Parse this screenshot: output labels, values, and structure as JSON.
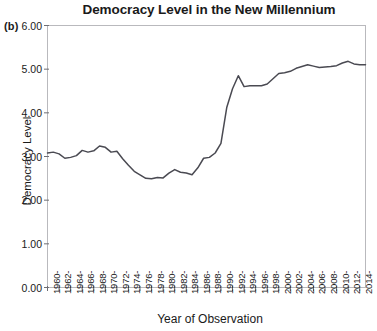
{
  "figure": {
    "panel_label": "(b)",
    "title": "Democracy Level in the New Millennium"
  },
  "chart_data": {
    "type": "line",
    "title": "Democracy Level in the New Millennium",
    "xlabel": "Year of Observation",
    "ylabel": "Democracy Level",
    "ylim": [
      0.0,
      6.0
    ],
    "ytick_labels": [
      "0.00",
      "1.00",
      "2.00",
      "3.00",
      "4.00",
      "5.00",
      "6.00"
    ],
    "ytick_values": [
      0.0,
      1.0,
      2.0,
      3.0,
      4.0,
      5.0,
      6.0
    ],
    "xlim": [
      1960,
      2015
    ],
    "xtick_labels": [
      "1960",
      "1962",
      "1964",
      "1966",
      "1968",
      "1970",
      "1972",
      "1974",
      "1976",
      "1978",
      "1980",
      "1982",
      "1984",
      "1986",
      "1988",
      "1990",
      "1992",
      "1994",
      "1996",
      "1998",
      "2000",
      "2002",
      "2004",
      "2006",
      "2008",
      "2010",
      "2012",
      "2014"
    ],
    "grid": false,
    "legend": null,
    "line_color": "#4a4a52",
    "x": [
      1960,
      1961,
      1962,
      1963,
      1964,
      1965,
      1966,
      1967,
      1968,
      1969,
      1970,
      1971,
      1972,
      1973,
      1974,
      1975,
      1976,
      1977,
      1978,
      1979,
      1980,
      1981,
      1982,
      1983,
      1984,
      1985,
      1986,
      1987,
      1988,
      1989,
      1990,
      1991,
      1992,
      1993,
      1994,
      1995,
      1996,
      1997,
      1998,
      1999,
      2000,
      2001,
      2002,
      2003,
      2004,
      2005,
      2006,
      2007,
      2008,
      2009,
      2010,
      2011,
      2012,
      2013,
      2014,
      2015
    ],
    "values": [
      3.08,
      3.1,
      3.06,
      2.96,
      2.98,
      3.02,
      3.14,
      3.1,
      3.13,
      3.24,
      3.21,
      3.1,
      3.12,
      2.95,
      2.8,
      2.66,
      2.58,
      2.5,
      2.49,
      2.52,
      2.51,
      2.62,
      2.7,
      2.64,
      2.62,
      2.58,
      2.74,
      2.96,
      2.98,
      3.08,
      3.3,
      4.12,
      4.55,
      4.85,
      4.6,
      4.62,
      4.62,
      4.62,
      4.66,
      4.78,
      4.9,
      4.92,
      4.95,
      5.02,
      5.06,
      5.1,
      5.07,
      5.04,
      5.05,
      5.06,
      5.08,
      5.14,
      5.18,
      5.12,
      5.1,
      5.1
    ]
  }
}
